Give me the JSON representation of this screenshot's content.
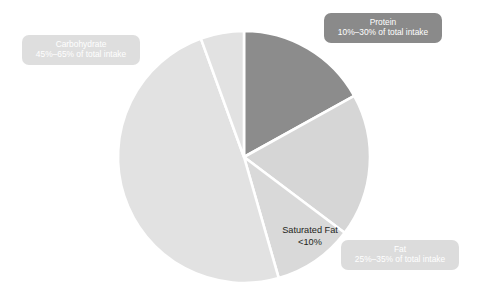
{
  "chart_data": {
    "type": "pie",
    "title": "",
    "subtitle": "",
    "xlabel": "",
    "ylabel": "",
    "legend_position": "callout-labels-on-chart",
    "grid": false,
    "start_angle_deg": 0,
    "direction": "clockwise",
    "center": {
      "x": 244,
      "y": 157
    },
    "radius": 126,
    "categories": [
      "Protein",
      "Fat",
      "Saturated Fat",
      "Carbohydrate"
    ],
    "values": [
      17,
      18,
      10,
      55
    ],
    "slices": [
      {
        "name": "Protein",
        "label_title": "Protein",
        "label_sub": "10%–30% of total intake",
        "range_text": "10%–30%",
        "range_min_pct": 10,
        "range_max_pct": 30,
        "value": 17,
        "start_deg": 0,
        "end_deg": 61,
        "color": "#8c8c8c"
      },
      {
        "name": "Fat",
        "label_title": "Fat",
        "label_sub": "25%–35% of total intake",
        "range_text": "25%–35%",
        "range_min_pct": 25,
        "range_max_pct": 35,
        "value": 18,
        "start_deg": 61,
        "end_deg": 127,
        "color": "#d6d6d6"
      },
      {
        "name": "Saturated Fat",
        "label_title": "Saturated Fat",
        "label_sub": "<10%",
        "range_text": "<10%",
        "range_min_pct": 0,
        "range_max_pct": 10,
        "value": 10,
        "start_deg": 127,
        "end_deg": 164,
        "color": "#d9d9d9"
      },
      {
        "name": "Carbohydrate",
        "label_title": "Carbohydrate",
        "label_sub": "45%–65% of total intake",
        "range_text": "45%–65%",
        "range_min_pct": 45,
        "range_max_pct": 65,
        "value": 55,
        "start_deg": 164,
        "end_deg": 340,
        "color": "#e2e2e2"
      },
      {
        "name": "Carbohydrate (upper wedge)",
        "label_title": "",
        "label_sub": "",
        "range_text": "",
        "value": 0,
        "start_deg": 340,
        "end_deg": 360,
        "color": "#e2e2e2"
      }
    ],
    "separator_color": "#ffffff",
    "background": "#ffffff"
  },
  "callouts": {
    "protein": {
      "title": "Protein",
      "sub": "10%–30% of total intake",
      "bg": "#8a8a8a",
      "text_color": "#ffffff"
    },
    "carbohydrate": {
      "title": "Carbohydrate",
      "sub": "45%–65% of total intake",
      "bg": "#dedede",
      "text_color": "#ffffff"
    },
    "fat": {
      "title": "Fat",
      "sub": "25%–35% of total intake",
      "bg": "#dcdcdc",
      "text_color": "#ffffff"
    },
    "saturated_fat": {
      "title": "Saturated Fat",
      "sub": "<10%",
      "text_color": "#231f20"
    }
  }
}
